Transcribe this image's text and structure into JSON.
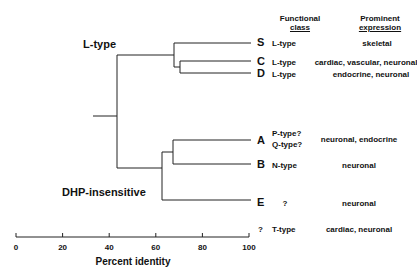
{
  "diagram": {
    "type": "dendrogram",
    "group_labels": {
      "l_type": "L-type",
      "dhp": "DHP-insensitive"
    },
    "headers": {
      "functional": [
        "Functional",
        "class"
      ],
      "expression": [
        "Prominent",
        "expression"
      ]
    },
    "leaves": [
      {
        "id": "S",
        "class": "L-type",
        "expression": "skeletal"
      },
      {
        "id": "C",
        "class": "L-type",
        "expression": "cardiac, vascular, neuronal"
      },
      {
        "id": "D",
        "class": "L-type",
        "expression": "endocrine, neuronal"
      },
      {
        "id": "A",
        "class": [
          "P-type?",
          "Q-type?"
        ],
        "expression": "neuronal, endocrine"
      },
      {
        "id": "B",
        "class": "N-type",
        "expression": "neuronal"
      },
      {
        "id": "E",
        "class": "?",
        "expression": "neuronal"
      },
      {
        "id": "?",
        "class": "T-type",
        "expression": "cardiac, neuronal"
      }
    ],
    "axis": {
      "label": "Percent identity",
      "ticks": [
        "0",
        "20",
        "40",
        "60",
        "80",
        "100"
      ]
    }
  }
}
